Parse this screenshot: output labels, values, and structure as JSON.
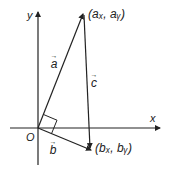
{
  "diagram": {
    "axes": {
      "x_label": "x",
      "y_label": "y",
      "origin_label": "O"
    },
    "points": {
      "A": {
        "label": "(aₓ, aᵧ)",
        "coords": "(ax, ay)"
      },
      "B": {
        "label": "(bₓ, bᵧ)",
        "coords": "(bx, by)"
      }
    },
    "vectors": {
      "a": {
        "label": "a",
        "arrow": "→"
      },
      "b": {
        "label": "b",
        "arrow": "→"
      },
      "c": {
        "label": "c",
        "arrow": "→"
      }
    },
    "colors": {
      "line": "#222222",
      "background": "#ffffff"
    }
  }
}
